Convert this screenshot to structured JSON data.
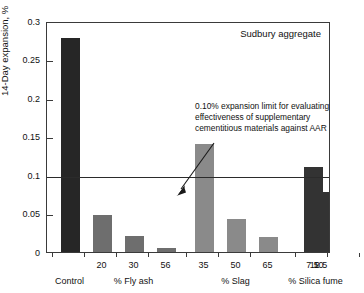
{
  "chart_data": {
    "type": "bar",
    "title": "",
    "corner_label": "Sudbury aggregate",
    "xlabel": "",
    "ylabel": "14-Day expansion, %",
    "ylim": [
      0,
      0.3
    ],
    "ytick_labels": [
      "0.3",
      "0.25",
      "0.2",
      "0.15",
      "0.1",
      "0.05",
      "0"
    ],
    "ytick_values": [
      0.3,
      0.25,
      0.2,
      0.15,
      0.1,
      0.05,
      0
    ],
    "grid": false,
    "legend": "none",
    "categories": [
      "Control",
      "20",
      "30",
      "56",
      "35",
      "50",
      "65",
      "7.5",
      "10",
      "12.5"
    ],
    "values": [
      0.278,
      0.048,
      0.021,
      0.005,
      0.14,
      0.043,
      0.019,
      0.111,
      0.078,
      0.052
    ],
    "bar_colors": [
      "#262626",
      "#6e6e6e",
      "#6e6e6e",
      "#6e6e6e",
      "#8a8a8a",
      "#8a8a8a",
      "#8a8a8a",
      "#333333",
      "#333333",
      "#333333"
    ],
    "groups": [
      {
        "label": "",
        "members": [
          "Control"
        ]
      },
      {
        "label": "% Fly ash",
        "members": [
          "20",
          "30",
          "56"
        ]
      },
      {
        "label": "% Slag",
        "members": [
          "35",
          "50",
          "65"
        ]
      },
      {
        "label": "% Silica fume",
        "members": [
          "7.5",
          "10",
          "12.5"
        ]
      }
    ],
    "group_labels": [
      "Control",
      "% Fly ash",
      "% Slag",
      "% Silica fume"
    ],
    "annotations": [
      {
        "text_lines": [
          "0.10% expansion limit for evaluating",
          "effectiveness of supplementary",
          "cementitious materials against AAR"
        ],
        "points_to_value": 0.1,
        "arrow": true
      }
    ],
    "reference_line": {
      "value": 0.1,
      "label": "0.10% expansion limit"
    }
  }
}
